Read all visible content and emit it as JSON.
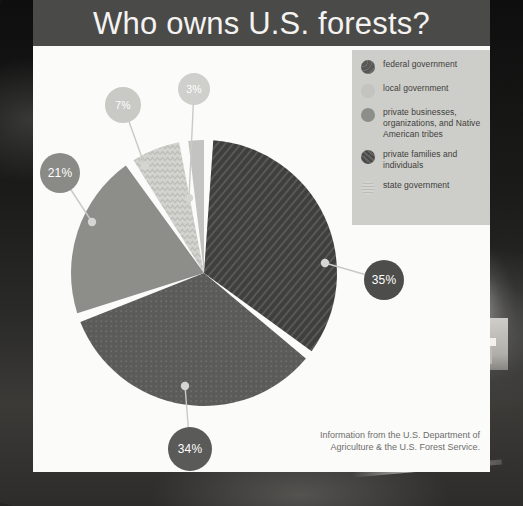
{
  "title": "Who owns U.S. forests?",
  "footer": {
    "line1": "Information from the U.S. Department of",
    "line2": "Agriculture & the U.S. Forest Service."
  },
  "legend": {
    "items": [
      {
        "label": "federal government",
        "color": "#585856",
        "pattern": "dots",
        "swatch_icon": "circle-swatch-federal"
      },
      {
        "label": "local government",
        "color": "#c3c3bf",
        "pattern": "solid",
        "swatch_icon": "circle-swatch-local"
      },
      {
        "label": "private businesses, organizations, and Native American tribes",
        "color": "#8d8d8a",
        "pattern": "solid",
        "swatch_icon": "circle-swatch-private-business"
      },
      {
        "label": "private families and individuals",
        "color": "#4a4a48",
        "pattern": "diagonal",
        "swatch_icon": "circle-swatch-private-families"
      },
      {
        "label": "state government",
        "color": "#d3d3cf",
        "pattern": "zigzag",
        "swatch_icon": "circle-swatch-state"
      }
    ]
  },
  "chart_data": {
    "type": "pie",
    "title": "Who owns U.S. forests?",
    "legend_position": "top-right",
    "grid": false,
    "unit": "percent",
    "categories": [
      "private families and individuals",
      "federal government",
      "private businesses, organizations, and Native American tribes",
      "state government",
      "local government"
    ],
    "values": [
      35,
      34,
      21,
      7,
      3
    ],
    "labels": [
      "35%",
      "34%",
      "21%",
      "7%",
      "3%"
    ],
    "slice_styles": [
      {
        "name": "private families and individuals",
        "color": "#3f3f3d",
        "pattern": "diagonal"
      },
      {
        "name": "federal government",
        "color": "#5b5b59",
        "pattern": "dots"
      },
      {
        "name": "private businesses, organizations, and Native American tribes",
        "color": "#8d8d8a",
        "pattern": "solid"
      },
      {
        "name": "state government",
        "color": "#d3d3cf",
        "pattern": "zigzag"
      },
      {
        "name": "local government",
        "color": "#c3c3bf",
        "pattern": "solid"
      }
    ],
    "callouts": [
      {
        "label": "35%",
        "value": 35,
        "bubble_color": "#4d4d4b",
        "text_color": "#ffffff"
      },
      {
        "label": "34%",
        "value": 34,
        "bubble_color": "#5a5a58",
        "text_color": "#ffffff"
      },
      {
        "label": "21%",
        "value": 21,
        "bubble_color": "#8a8a87",
        "text_color": "#ffffff"
      },
      {
        "label": "7%",
        "value": 7,
        "bubble_color": "#c9c9c5",
        "text_color": "#ffffff"
      },
      {
        "label": "3%",
        "value": 3,
        "bubble_color": "#cfcfcb",
        "text_color": "#ffffff"
      }
    ]
  }
}
